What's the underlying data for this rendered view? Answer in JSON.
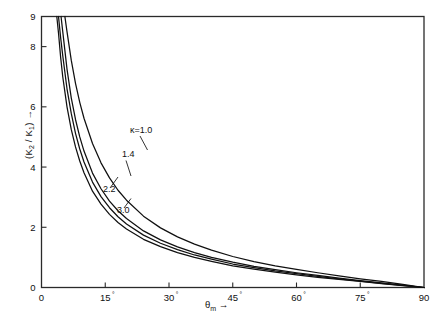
{
  "chart_data": {
    "type": "line",
    "title": "",
    "xlabel": "θm →",
    "ylabel": "(K2 / K1) →",
    "xlim": [
      0,
      90
    ],
    "ylim": [
      0,
      9
    ],
    "grid": false,
    "legend_position": "inline-curve-labels",
    "x_tick_labels": [
      "0",
      "15°",
      "30°",
      "45°",
      "60°",
      "75°",
      "90"
    ],
    "x_ticks": [
      0,
      15,
      30,
      45,
      60,
      75,
      90
    ],
    "y_tick_labels": [
      "0",
      "2",
      "4",
      "6",
      "8",
      "9"
    ],
    "y_ticks": [
      0,
      2,
      4,
      6,
      8,
      9
    ],
    "series": [
      {
        "name": "κ=1.0",
        "label": "κ=1.0",
        "x": [
          5.5,
          6,
          7,
          8,
          9,
          10,
          12,
          14,
          16,
          18,
          20,
          24,
          28,
          32,
          36,
          40,
          45,
          50,
          55,
          60,
          65,
          70,
          75,
          80,
          85,
          90
        ],
        "y": [
          9.0,
          8.5,
          7.55,
          6.78,
          6.15,
          5.62,
          4.78,
          4.14,
          3.64,
          3.23,
          2.9,
          2.37,
          1.98,
          1.68,
          1.44,
          1.24,
          1.03,
          0.86,
          0.72,
          0.6,
          0.49,
          0.39,
          0.29,
          0.2,
          0.1,
          0.0
        ]
      },
      {
        "name": "κ=1.4",
        "label": "1.4",
        "x": [
          4.6,
          5,
          6,
          7,
          8,
          9,
          10,
          12,
          14,
          16,
          18,
          20,
          24,
          28,
          32,
          36,
          40,
          45,
          50,
          55,
          60,
          65,
          70,
          75,
          80,
          85,
          90
        ],
        "y": [
          9.0,
          8.5,
          7.25,
          6.3,
          5.58,
          5.0,
          4.53,
          3.8,
          3.28,
          2.87,
          2.55,
          2.29,
          1.88,
          1.58,
          1.35,
          1.16,
          1.0,
          0.84,
          0.7,
          0.59,
          0.49,
          0.4,
          0.31,
          0.23,
          0.15,
          0.08,
          0.0
        ]
      },
      {
        "name": "κ=2.2",
        "label": "2.2",
        "x": [
          4.0,
          4.5,
          5,
          6,
          7,
          8,
          9,
          10,
          12,
          14,
          16,
          18,
          20,
          24,
          28,
          32,
          36,
          40,
          45,
          50,
          55,
          60,
          65,
          70,
          75,
          80,
          85,
          90
        ],
        "y": [
          9.0,
          8.3,
          7.7,
          6.6,
          5.78,
          5.12,
          4.6,
          4.17,
          3.5,
          3.02,
          2.65,
          2.35,
          2.11,
          1.74,
          1.47,
          1.26,
          1.08,
          0.94,
          0.78,
          0.66,
          0.55,
          0.46,
          0.37,
          0.29,
          0.21,
          0.14,
          0.07,
          0.0
        ]
      },
      {
        "name": "κ=3.0",
        "label": "3.0",
        "x": [
          3.6,
          4,
          4.5,
          5,
          6,
          7,
          8,
          9,
          10,
          12,
          14,
          16,
          18,
          20,
          24,
          28,
          32,
          36,
          40,
          45,
          50,
          55,
          60,
          65,
          70,
          75,
          80,
          85,
          90
        ],
        "y": [
          9.0,
          8.45,
          7.65,
          7.0,
          6.0,
          5.25,
          4.67,
          4.2,
          3.81,
          3.2,
          2.77,
          2.43,
          2.16,
          1.94,
          1.6,
          1.36,
          1.16,
          1.0,
          0.87,
          0.72,
          0.61,
          0.51,
          0.42,
          0.34,
          0.27,
          0.2,
          0.13,
          0.065,
          0.0
        ]
      }
    ],
    "annotations": [
      {
        "text": "κ=1.0",
        "x_px": 130,
        "y_px": 133
      },
      {
        "text": "1.4",
        "x_px": 122,
        "y_px": 157
      },
      {
        "text": "2.2",
        "x_px": 103,
        "y_px": 192
      },
      {
        "text": "3.0",
        "x_px": 117,
        "y_px": 213
      }
    ]
  },
  "axes": {
    "y_axis_title": "(K",
    "y_axis_sub1": "2",
    "y_axis_mid": " / K",
    "y_axis_sub2": "1",
    "y_axis_tail": ") →",
    "x_axis_title": "θ",
    "x_axis_sub": "m",
    "x_axis_tail": "→"
  },
  "colors": {
    "curve": "#101010",
    "frame": "#2a2a2a",
    "background": "#ffffff",
    "text": "#111111"
  }
}
